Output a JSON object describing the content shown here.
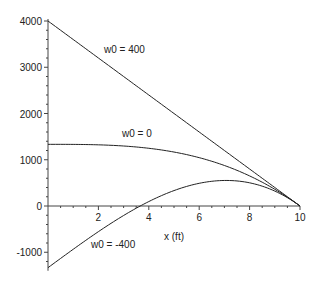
{
  "chart_data": {
    "type": "line",
    "title": "",
    "xlabel": "x (ft)",
    "ylabel": "",
    "xlim": [
      0,
      10
    ],
    "ylim": [
      -1333,
      4000
    ],
    "grid": false,
    "legend": "inline labels",
    "x_ticks": [
      2,
      4,
      6,
      8,
      10
    ],
    "y_ticks": [
      -1000,
      0,
      1000,
      2000,
      3000,
      4000
    ],
    "x_tick_labels": [
      "2",
      "4",
      "6",
      "8",
      "10"
    ],
    "y_tick_labels": [
      "-1000",
      "0",
      "1000",
      "2000",
      "3000",
      "4000"
    ],
    "x": [
      0,
      1,
      2,
      3,
      4,
      5,
      6,
      7,
      8,
      9,
      10
    ],
    "series": [
      {
        "name": "w0 = 400",
        "values": [
          4000,
          3600,
          3200,
          2800,
          2400,
          2000,
          1600,
          1200,
          800,
          400,
          0
        ]
      },
      {
        "name": "w0 = 0",
        "values": [
          1333,
          1332,
          1323,
          1297,
          1248,
          1167,
          1045,
          876,
          651,
          361,
          0
        ]
      },
      {
        "name": "w0 = -400",
        "values": [
          -1333,
          -936,
          -554,
          -206,
          96,
          333,
          491,
          552,
          501,
          322,
          0
        ]
      }
    ],
    "annotations": [
      {
        "text": "w0 = 400",
        "x": 3.3,
        "y": 3400
      },
      {
        "text": "w0 = 0",
        "x": 3.9,
        "y": 1450
      },
      {
        "text": "w0 = -400",
        "x": 1.7,
        "y": -800
      },
      {
        "text": "x (ft)",
        "x": 4.7,
        "y": -650
      }
    ]
  },
  "colors": {
    "line": "#222222",
    "axis": "#444444",
    "background": "#ffffff"
  }
}
